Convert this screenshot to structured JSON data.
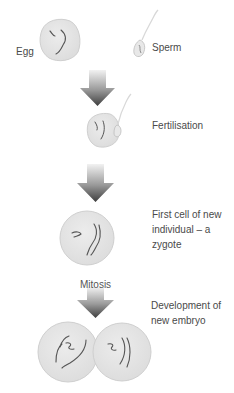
{
  "labels": {
    "egg": "Egg",
    "sperm": "Sperm",
    "fertilisation": "Fertilisation",
    "zygote_line1": "First cell of new",
    "zygote_line2": "individual – a",
    "zygote_line3": "zygote",
    "mitosis": "Mitosis",
    "embryo_line1": "Development of",
    "embryo_line2": "new embryo"
  },
  "colors": {
    "cell_fill": "#e6e6e6",
    "cell_stroke": "#cfcfcf",
    "chromosome": "#555555",
    "arrow_top": "#eeeeee",
    "arrow_bottom": "#444444",
    "text": "#4a4a4a"
  },
  "stages": [
    {
      "name": "egg-and-sperm"
    },
    {
      "name": "fertilisation"
    },
    {
      "name": "zygote"
    },
    {
      "name": "two-cell-embryo"
    }
  ]
}
